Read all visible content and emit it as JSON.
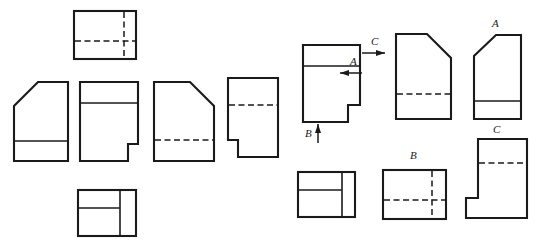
{
  "drawing": {
    "title": "Orthographic projection exercise — multiview engineering drawing",
    "line_color": "#1a1a1a",
    "background": "#ffffff",
    "labels": [
      {
        "id": "arrow-a",
        "text": "A",
        "x": 350,
        "y": 62,
        "note": "direction arrow A, pointing left"
      },
      {
        "id": "arrow-b",
        "text": "B",
        "x": 307,
        "y": 125,
        "note": "direction arrow B, pointing up"
      },
      {
        "id": "arrow-c",
        "text": "C",
        "x": 371,
        "y": 42,
        "note": "direction arrow C, pointing right"
      },
      {
        "id": "view-a",
        "text": "A",
        "x": 492,
        "y": 22,
        "note": "view A caption, upper right"
      },
      {
        "id": "view-b",
        "text": "B",
        "x": 412,
        "y": 148,
        "note": "view B caption, lower middle"
      },
      {
        "id": "view-c",
        "text": "C",
        "x": 494,
        "y": 128,
        "note": "view C caption, lower right"
      }
    ],
    "figures": [
      {
        "id": "left-top-view",
        "kind": "rectangle-with-hidden-lines",
        "group": "left"
      },
      {
        "id": "left-front-chamfer",
        "kind": "chamfered-block",
        "group": "left"
      },
      {
        "id": "left-stepped-block",
        "kind": "stepped-block",
        "group": "left"
      },
      {
        "id": "left-chamfer-hidden",
        "kind": "chamfered-block-hidden",
        "group": "left"
      },
      {
        "id": "left-notch-block",
        "kind": "notched-block-hidden",
        "group": "left"
      },
      {
        "id": "left-bottom-view",
        "kind": "rectangle-divided",
        "group": "left"
      },
      {
        "id": "main-front-view",
        "kind": "stepped-block-main",
        "group": "right"
      },
      {
        "id": "right-chamfer-view",
        "kind": "chamfered-block-hidden",
        "group": "right"
      },
      {
        "id": "view-a-figure",
        "kind": "chamfered-block",
        "group": "right"
      },
      {
        "id": "right-bottom-left",
        "kind": "rectangle-divided",
        "group": "right"
      },
      {
        "id": "view-b-figure",
        "kind": "rectangle-with-hidden-lines",
        "group": "right"
      },
      {
        "id": "view-c-figure",
        "kind": "notched-block-hidden",
        "group": "right"
      }
    ]
  }
}
